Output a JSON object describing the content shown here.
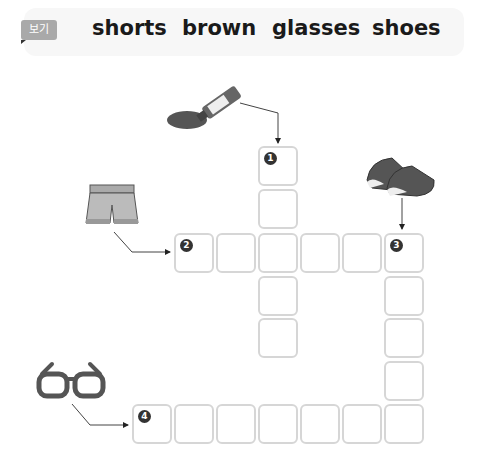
{
  "word_bank": {
    "tag": "보기",
    "words": [
      "shorts",
      "brown",
      "glasses",
      "shoes"
    ]
  },
  "clues": [
    {
      "number": "1",
      "picture": "paint-tube-icon",
      "direction": "down",
      "length": 5
    },
    {
      "number": "2",
      "picture": "shorts-icon",
      "direction": "across",
      "length": 6
    },
    {
      "number": "3",
      "picture": "shoes-icon",
      "direction": "down",
      "length": 5
    },
    {
      "number": "4",
      "picture": "glasses-icon",
      "direction": "across",
      "length": 7
    }
  ]
}
